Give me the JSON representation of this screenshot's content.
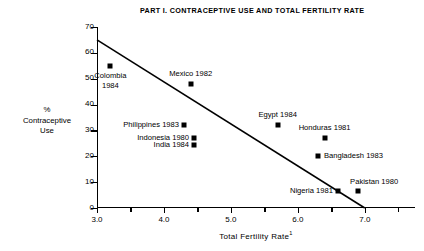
{
  "chart_data": {
    "type": "scatter",
    "title": "PART I.  CONTRACEPTIVE USE AND TOTAL FERTILITY RATE",
    "xlabel": "Total Fertility Rate",
    "xlabel_footnote": "1",
    "ylabel_lines": [
      "%",
      "Contraceptive",
      "Use"
    ],
    "xlim": [
      3.0,
      7.75
    ],
    "ylim": [
      0,
      70
    ],
    "xticks": [
      3.0,
      4.0,
      5.0,
      6.0,
      7.0
    ],
    "xticklabels": [
      "3.0",
      "4.0",
      "5.0",
      "6.0",
      "7.0"
    ],
    "xticks_minor": [
      3.5,
      4.5,
      5.5,
      6.5,
      7.5
    ],
    "yticks": [
      0,
      10,
      20,
      30,
      40,
      50,
      60,
      70
    ],
    "yticklabels": [
      "0",
      "10",
      "20",
      "30",
      "40",
      "50",
      "60",
      "70"
    ],
    "grid": false,
    "legend": "none",
    "points": [
      {
        "name": "Colombia 1984",
        "label": "Colombia\n1984",
        "x": 3.2,
        "y": 55.0,
        "label_pos": "below"
      },
      {
        "name": "Mexico 1982",
        "label": "Mexico 1982",
        "x": 4.4,
        "y": 48.0,
        "label_pos": "above"
      },
      {
        "name": "Philippines 1983",
        "label": "Philippines 1983",
        "x": 4.3,
        "y": 32.0,
        "label_pos": "left"
      },
      {
        "name": "Indonesia 1980",
        "label": "Indonesia 1980",
        "x": 4.45,
        "y": 27.0,
        "label_pos": "left"
      },
      {
        "name": "India 1984",
        "label": "India 1984",
        "x": 4.45,
        "y": 24.5,
        "label_pos": "left"
      },
      {
        "name": "Egypt 1984",
        "label": "Egypt 1984",
        "x": 5.7,
        "y": 32.0,
        "label_pos": "above"
      },
      {
        "name": "Honduras 1981",
        "label": "Honduras 1981",
        "x": 6.4,
        "y": 27.0,
        "label_pos": "above"
      },
      {
        "name": "Bangladesh 1983",
        "label": "Bangladesh 1983",
        "x": 6.3,
        "y": 20.0,
        "label_pos": "right"
      },
      {
        "name": "Nigeria 1981",
        "label": "Nigeria 1981",
        "x": 6.6,
        "y": 6.5,
        "label_pos": "left"
      },
      {
        "name": "Pakistan 1980",
        "label": "Pakistan 1980",
        "x": 6.9,
        "y": 6.5,
        "label_pos": "above-right"
      }
    ],
    "trend_line": {
      "name": "regression-line",
      "x0": 3.0,
      "y0": 65.0,
      "x1": 7.0,
      "y1": 0.0
    }
  }
}
